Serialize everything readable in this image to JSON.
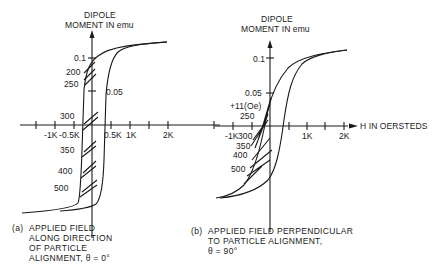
{
  "figure": {
    "panel_a": {
      "y_axis_title_line1": "DIPOLE",
      "y_axis_title_line2": "MOMENT IN emu",
      "y_ticks": [
        "0.1",
        "0.05"
      ],
      "x_ticks": [
        "-1K",
        "-0.5K",
        "0.5K",
        "1K",
        "2K"
      ],
      "curve_labels": [
        "200",
        "250",
        "300",
        "350",
        "400",
        "500"
      ],
      "caption_prefix": "(a)",
      "caption_lines": [
        "APPLIED FIELD",
        "ALONG DIRECTION",
        "OF PARTICLE",
        "ALIGNMENT, θ = 0°"
      ]
    },
    "panel_b": {
      "y_axis_title_line1": "DIPOLE",
      "y_axis_title_line2": "MOMENT IN emu",
      "y_ticks": [
        "0.1",
        "0.05"
      ],
      "x_ticks": [
        "-1K",
        "1K",
        "2K"
      ],
      "x_axis_title": "H IN OERSTEDS",
      "curve_labels": [
        "+11(Oe)",
        "250",
        "300",
        "350",
        "400",
        "500"
      ],
      "caption_prefix": "(b)",
      "caption_lines": [
        "APPLIED FIELD PERPENDICULAR",
        "TO PARTICLE ALIGNMENT,",
        "θ = 90°"
      ]
    },
    "colors": {
      "ink": "#1a1a1a",
      "background": "#ffffff"
    }
  }
}
